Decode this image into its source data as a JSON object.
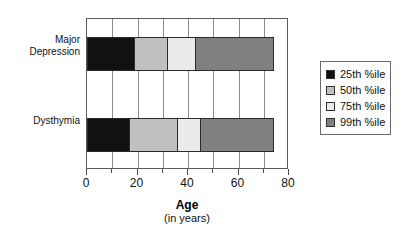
{
  "chart_data": {
    "type": "bar",
    "orientation": "horizontal",
    "stacked": true,
    "title": "",
    "xlabel": "Age",
    "xlabel_sub": "(in years)",
    "ylabel": "",
    "xlim": [
      0,
      80
    ],
    "xticks": [
      0,
      20,
      40,
      60,
      80
    ],
    "xtick_labels": [
      "0",
      "20",
      "40",
      "60",
      "80"
    ],
    "minor_gridlines": [
      10,
      30,
      50,
      70
    ],
    "grid": true,
    "legend_position": "right",
    "categories": [
      "Major Depression",
      "Dysthymia"
    ],
    "series": [
      {
        "name": "25th %ile",
        "color": "#111111",
        "values": [
          19,
          17
        ]
      },
      {
        "name": "50th %ile",
        "color": "#c0c0c0",
        "values": [
          32,
          36
        ]
      },
      {
        "name": "75th %ile",
        "color": "#ebebeb",
        "values": [
          43,
          45
        ]
      },
      {
        "name": "99th %ile",
        "color": "#808080",
        "values": [
          74,
          74
        ]
      }
    ]
  },
  "axis": {
    "x": {
      "ticks": [
        {
          "label": "0",
          "value": 0
        },
        {
          "label": "20",
          "value": 20
        },
        {
          "label": "40",
          "value": 40
        },
        {
          "label": "60",
          "value": 60
        },
        {
          "label": "80",
          "value": 80
        }
      ],
      "title_main": "Age",
      "title_sub": "(in years)"
    },
    "y": {
      "categories": [
        {
          "label": "Major\nDepression"
        },
        {
          "label": "Dysthymia"
        }
      ]
    }
  },
  "legend": {
    "items": [
      {
        "label": "25th %ile",
        "color": "#111111"
      },
      {
        "label": "50th %ile",
        "color": "#c0c0c0"
      },
      {
        "label": "75th %ile",
        "color": "#ebebeb"
      },
      {
        "label": "99th %ile",
        "color": "#808080"
      }
    ]
  }
}
